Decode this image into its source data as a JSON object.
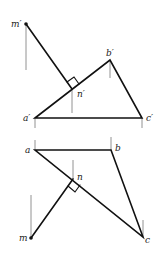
{
  "diagram": {
    "colors": {
      "line": "#111111",
      "projection": "#777777",
      "background": "#ffffff"
    },
    "elevation": {
      "labels": {
        "m": "m′",
        "a": "a′",
        "b": "b′",
        "c": "c′",
        "n": "n′"
      },
      "points": {
        "m": [
          26,
          24
        ],
        "a": [
          35,
          118
        ],
        "b": [
          110,
          60
        ],
        "c": [
          142,
          118
        ],
        "n": [
          72,
          89
        ]
      }
    },
    "plan": {
      "labels": {
        "m": "m",
        "a": "a",
        "b": "b",
        "c": "c",
        "n": "n"
      },
      "points": {
        "m": [
          31,
          238
        ],
        "a": [
          35,
          150
        ],
        "b": [
          111,
          150
        ],
        "c": [
          143,
          237
        ],
        "n": [
          73,
          179
        ]
      }
    }
  }
}
